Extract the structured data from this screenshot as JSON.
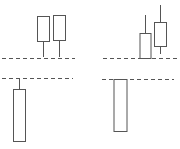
{
  "chart_data": {
    "type": "candlestick",
    "title": "",
    "xlabel": "",
    "ylabel": "",
    "grid": false,
    "legend": null,
    "colors": {
      "stroke": "#555555",
      "fill": "#ffffff",
      "dashed": "#555555"
    },
    "panels": [
      {
        "name": "left-pattern",
        "dashed_lines": [
          {
            "y": 58,
            "x1": 2,
            "x2": 75
          },
          {
            "y": 78,
            "x1": 2,
            "x2": 73
          }
        ],
        "candles": [
          {
            "name": "long-candle-below",
            "x": 19,
            "body_top": 89,
            "body_bottom": 141,
            "wick_top": 78,
            "wick_bottom": 141,
            "width": 12
          },
          {
            "name": "small-candle-1",
            "x": 43,
            "body_top": 16,
            "body_bottom": 41,
            "wick_top": 16,
            "wick_bottom": 57,
            "width": 12
          },
          {
            "name": "small-candle-2",
            "x": 59,
            "body_top": 15,
            "body_bottom": 40,
            "wick_top": 15,
            "wick_bottom": 57,
            "width": 12
          }
        ]
      },
      {
        "name": "right-pattern",
        "dashed_lines": [
          {
            "y": 58,
            "x1": 103,
            "x2": 178
          },
          {
            "y": 79,
            "x1": 102,
            "x2": 174
          }
        ],
        "candles": [
          {
            "name": "long-candle-below",
            "x": 120,
            "body_top": 79,
            "body_bottom": 131,
            "wick_top": 79,
            "wick_bottom": 131,
            "width": 13
          },
          {
            "name": "small-candle-1",
            "x": 145,
            "body_top": 33,
            "body_bottom": 58,
            "wick_top": 15,
            "wick_bottom": 58,
            "width": 11
          },
          {
            "name": "small-candle-2",
            "x": 160,
            "body_top": 22,
            "body_bottom": 46,
            "wick_top": 5,
            "wick_bottom": 54,
            "width": 12
          }
        ]
      }
    ]
  }
}
